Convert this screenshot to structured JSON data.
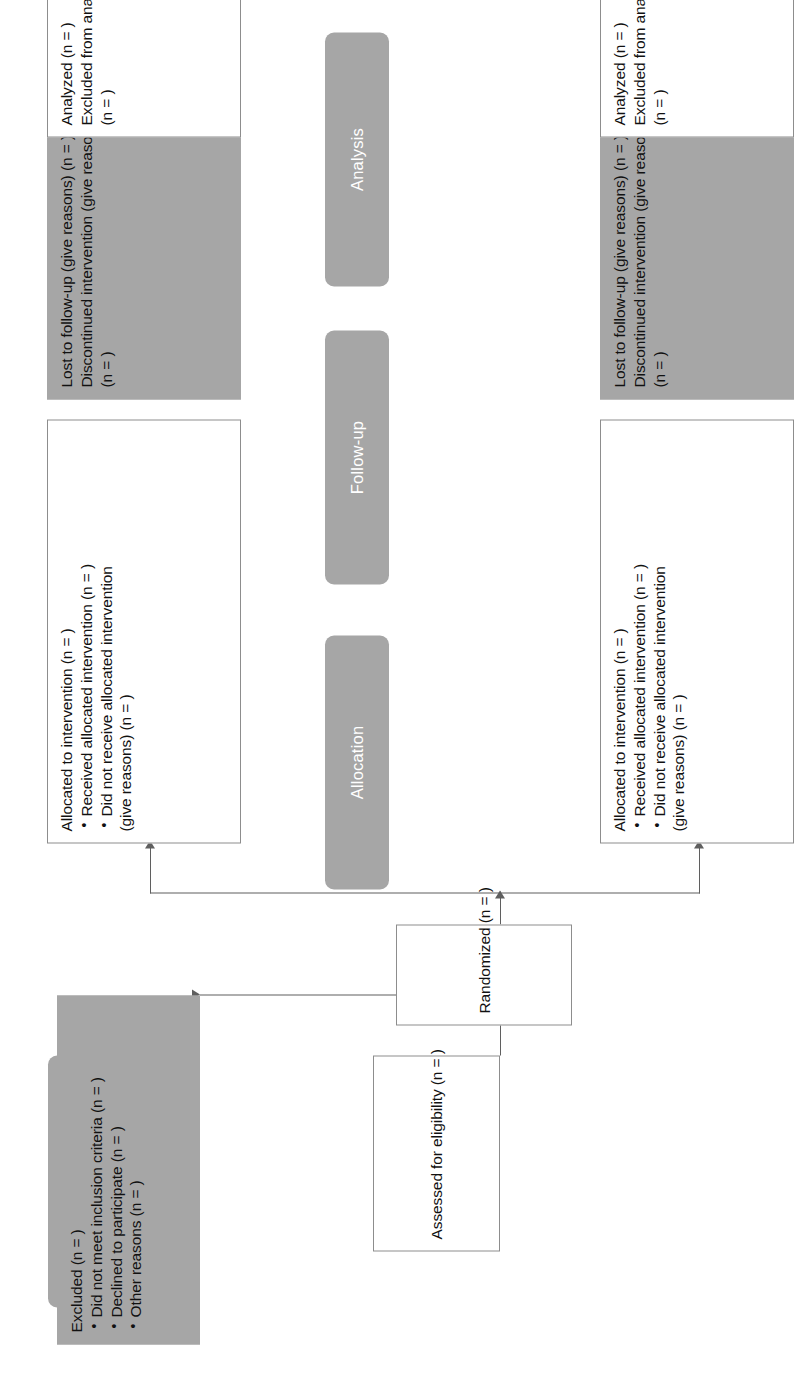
{
  "diagram": {
    "colors": {
      "gray_fill": "#a6a6a6",
      "box_border": "#8d8d8d",
      "line": "#5f5f5f",
      "stage_label_text": "#ffffff",
      "body_text": "#111111",
      "background": "#ffffff"
    }
  },
  "stages": [
    {
      "id": "enrollment",
      "label": "Enrollment"
    },
    {
      "id": "allocation",
      "label": "Allocation"
    },
    {
      "id": "followup",
      "label": "Follow-up"
    },
    {
      "id": "analysis",
      "label": "Analysis"
    }
  ],
  "boxes": {
    "assessed": {
      "lines": [
        "Assessed for eligibility (n = )"
      ]
    },
    "excluded": {
      "heading": "Excluded (n = )",
      "bullets": [
        "Did not meet inclusion criteria (n = )",
        "Declined to participate (n = )",
        "Other reasons (n = )"
      ]
    },
    "randomized": {
      "lines": [
        "Randomized (n = )"
      ]
    },
    "allocated_top": {
      "heading": "Allocated to intervention (n = )",
      "bullets": [
        "Received allocated intervention (n = )",
        "Did not receive allocated intervention (give reasons) (n = )"
      ],
      "bullet_wraps": [
        "",
        "(give reasons) (n = )"
      ]
    },
    "allocated_bottom": {
      "heading": "Allocated to intervention (n = )",
      "bullets": [
        "Received allocated intervention (n = )",
        "Did not receive allocated intervention (give reasons) (n = )"
      ],
      "bullet_wraps": [
        "",
        "(give reasons) (n = )"
      ]
    },
    "followup_top": {
      "lines": [
        "Lost to follow-up (give reasons) (n = )",
        "Discontinued intervention (give reasons)",
        "(n = )"
      ]
    },
    "followup_bottom": {
      "lines": [
        "Lost to follow-up (give reasons) (n = )",
        "Discontinued intervention (give reasons)",
        "(n = )"
      ]
    },
    "analysis_top": {
      "lines": [
        "Analyzed (n = )",
        "Excluded from analysis (give reasons)",
        "(n = )"
      ]
    },
    "analysis_bottom": {
      "lines": [
        "Analyzed (n = )",
        "Excluded from analysis (give reasons)",
        "(n = )"
      ]
    }
  },
  "bullet_text": {
    "allocated_line1": "Received allocated intervention (n = )",
    "allocated_line2a": "Did not receive allocated intervention",
    "allocated_line2b": "(give reasons) (n = )"
  }
}
